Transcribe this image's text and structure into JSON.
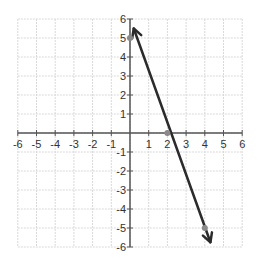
{
  "chart_data": {
    "type": "line",
    "title": "",
    "xlabel": "",
    "ylabel": "",
    "xlim": [
      -6,
      6
    ],
    "ylim": [
      -6,
      6
    ],
    "grid": true,
    "x_ticks": [
      -6,
      -5,
      -4,
      -3,
      -2,
      -1,
      1,
      2,
      3,
      4,
      5,
      6
    ],
    "y_ticks": [
      -6,
      -5,
      -4,
      -3,
      -2,
      -1,
      1,
      2,
      3,
      4,
      5,
      6
    ],
    "series": [
      {
        "name": "line",
        "equation": "y = -5/2 x + 5",
        "slope": -2.5,
        "intercept": 5,
        "arrows": "both",
        "x": [
          0.2,
          4.3
        ],
        "y": [
          5.5,
          -5.75
        ],
        "marked_points": [
          {
            "x": 0,
            "y": 5
          },
          {
            "x": 2,
            "y": 0
          },
          {
            "x": 4,
            "y": -5
          }
        ]
      }
    ],
    "colors": {
      "line": "#2b2b2b",
      "points": "#8a8a8a",
      "axis": "#555555",
      "grid": "#d9d9d9"
    }
  }
}
